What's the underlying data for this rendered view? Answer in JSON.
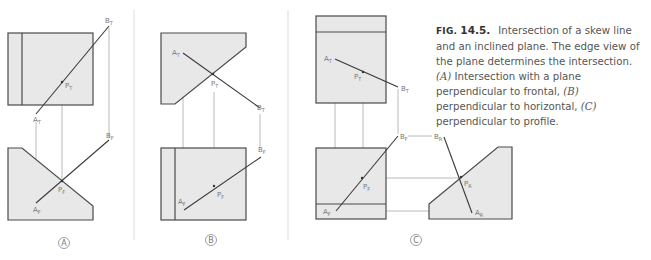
{
  "caption": {
    "fig_prefix": "FIG.",
    "fig_number": "14.5.",
    "text_1": "Intersection of a skew line and an inclined plane. The edge view of the plane determines the intersection. ",
    "ref_a": "(A)",
    "text_2": " Intersection with a plane perpendicular to frontal, ",
    "ref_b": "(B)",
    "text_3": " perpendicular to horizontal, ",
    "ref_c": "(C)",
    "text_4": " perpendicular to profile."
  },
  "panels": [
    {
      "id": "A",
      "label": "A",
      "points": {
        "A_T": [
          "A",
          "T"
        ],
        "B_T": [
          "B",
          "T"
        ],
        "P_T": [
          "P",
          "T"
        ],
        "A_F": [
          "A",
          "F"
        ],
        "B_F": [
          "B",
          "F"
        ],
        "P_F": [
          "P",
          "F"
        ]
      }
    },
    {
      "id": "B",
      "label": "B",
      "points": {
        "A_T": [
          "A",
          "T"
        ],
        "B_T": [
          "B",
          "T"
        ],
        "P_T": [
          "P",
          "T"
        ],
        "A_F": [
          "A",
          "F"
        ],
        "B_F": [
          "B",
          "F"
        ],
        "P_F": [
          "P",
          "F"
        ]
      }
    },
    {
      "id": "C",
      "label": "C",
      "points": {
        "A_T": [
          "A",
          "T"
        ],
        "B_T": [
          "B",
          "T"
        ],
        "P_T": [
          "P",
          "T"
        ],
        "A_F": [
          "A",
          "F"
        ],
        "B_F": [
          "B",
          "F"
        ],
        "P_F": [
          "P",
          "F"
        ],
        "A_R": [
          "A",
          "R"
        ],
        "B_R": [
          "B",
          "R"
        ],
        "P_R": [
          "P",
          "R"
        ]
      }
    }
  ],
  "colors": {
    "plane_fill": "#e8e8e8",
    "outline": "#4a4a4a",
    "projection_line": "#a8a8a8",
    "label_text": "#777777"
  }
}
